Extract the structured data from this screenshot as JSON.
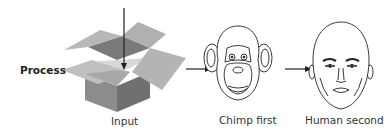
{
  "labels": {
    "process": "Process",
    "input": "Input",
    "chimp": "Chimp first",
    "human": "Human second"
  },
  "colors": {
    "box_light": "#b0b0b0",
    "box_mid": "#8e8e8e",
    "box_dark": "#6e6e6e",
    "line": "#222222"
  }
}
